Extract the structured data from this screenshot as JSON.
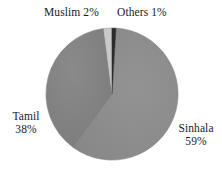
{
  "chart_data": {
    "type": "pie",
    "title": "",
    "subtitle": "",
    "xlabel": "",
    "ylabel": "",
    "legend_position": "none",
    "grid": false,
    "labels_inline": true,
    "categories": [
      "Sinhala",
      "Tamil",
      "Muslim",
      "Others"
    ],
    "values": [
      59,
      38,
      2,
      1
    ],
    "value_unit": "%",
    "slices": [
      {
        "name": "Sinhala",
        "value": 59,
        "display_value": "59%",
        "color": "#8d8d8d",
        "label_position": "right",
        "start_angle_deg": 4,
        "end_angle_deg": 216
      },
      {
        "name": "Tamil",
        "value": 38,
        "display_value": "38%",
        "color": "#838383",
        "label_position": "left",
        "start_angle_deg": 216,
        "end_angle_deg": 353
      },
      {
        "name": "Muslim",
        "value": 2,
        "display_value": "2%",
        "color": "#c8c8c8",
        "label_position": "top-left",
        "start_angle_deg": 353,
        "end_angle_deg": 360.2
      },
      {
        "name": "Others",
        "value": 1,
        "display_value": "1%",
        "color": "#2b2b2b",
        "label_position": "top-right",
        "start_angle_deg": 360.2,
        "end_angle_deg": 364
      }
    ],
    "geometry": {
      "center_x": 112,
      "center_y": 94,
      "radius": 66
    }
  },
  "labels": {
    "muslim": "Muslim 2%",
    "others": "Others 1%",
    "tamil_name": "Tamil",
    "tamil_value": "38%",
    "sinhala_name": "Sinhala",
    "sinhala_value": "59%"
  },
  "colors": {
    "background": "#ffffff",
    "text": "#1a1a1a",
    "sinhala": "#8d8d8d",
    "tamil": "#838383",
    "muslim": "#c8c8c8",
    "others": "#2b2b2b",
    "outline": "#6f6f6f"
  }
}
